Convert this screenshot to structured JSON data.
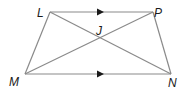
{
  "diagram": {
    "type": "trapezoid",
    "points": {
      "L": {
        "label": "L",
        "x": 50,
        "y": 12
      },
      "P": {
        "label": "P",
        "x": 153,
        "y": 12
      },
      "M": {
        "label": "M",
        "x": 25,
        "y": 74
      },
      "N": {
        "label": "N",
        "x": 171,
        "y": 74
      },
      "J": {
        "label": "J",
        "x": 100,
        "y": 38
      }
    },
    "segments": [
      {
        "from": "L",
        "to": "P",
        "parallel_marker": true
      },
      {
        "from": "M",
        "to": "N",
        "parallel_marker": true
      },
      {
        "from": "L",
        "to": "M"
      },
      {
        "from": "P",
        "to": "N"
      },
      {
        "from": "L",
        "to": "N"
      },
      {
        "from": "P",
        "to": "M"
      }
    ],
    "colors": {
      "line": "#8a8a8a",
      "label": "#1a1a1a",
      "arrow": "#1a1a1a"
    }
  }
}
